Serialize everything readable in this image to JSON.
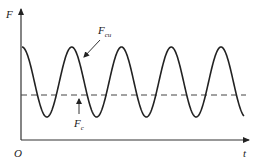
{
  "diagram": {
    "type": "force-time waveform",
    "axes": {
      "y_label": "F",
      "x_label": "t",
      "origin_label": "O"
    },
    "annotations": {
      "oscillating_label_main": "F",
      "oscillating_label_sub": "cu",
      "constant_label_main": "F",
      "constant_label_sub": "c"
    },
    "curve": {
      "shape": "cosine",
      "peaks_x": [
        22,
        71,
        121,
        171,
        221
      ],
      "troughs_x": [
        47,
        96,
        146,
        196
      ],
      "peak_y": 47,
      "trough_y": 117,
      "x_start": 22,
      "x_end": 244
    },
    "mean_line": {
      "style": "dashed",
      "y": 95
    },
    "colors": {
      "line": "#222222",
      "background": "#ffffff"
    }
  }
}
